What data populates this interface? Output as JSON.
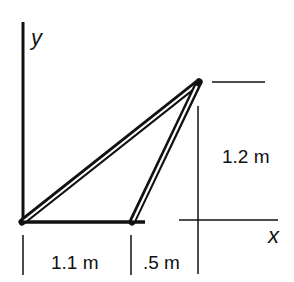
{
  "diagram": {
    "axes": {
      "y_label": "y",
      "x_label": "x"
    },
    "dimensions": {
      "height_label": "1.2 m",
      "base_left_label": "1.1 m",
      "base_right_label": ".5 m"
    },
    "colors": {
      "stroke": "#111111",
      "background": "#ffffff"
    }
  }
}
